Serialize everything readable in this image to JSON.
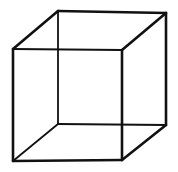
{
  "figure": {
    "line_color": "#111111",
    "background": "#ffffff",
    "front_face": {
      "tl": [
        13,
        49
      ],
      "tr": [
        122,
        50
      ],
      "br": [
        122,
        160
      ],
      "bl": [
        13,
        161
      ]
    },
    "back_face": {
      "tl": [
        58,
        11
      ],
      "tr": [
        166,
        13
      ],
      "br": [
        166,
        125
      ],
      "bl": [
        58,
        124
      ]
    }
  }
}
